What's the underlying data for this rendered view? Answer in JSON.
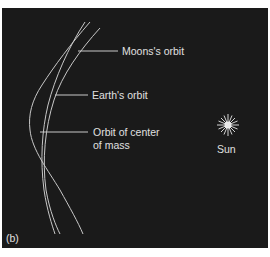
{
  "figure": {
    "panel_label": "(b)",
    "background_color": "#1a1a1a",
    "line_color": "#c8c8c8",
    "labels": {
      "moon_orbit": "Moons's orbit",
      "earth_orbit": "Earth's orbit",
      "center_of_mass_line1": "Orbit of center",
      "center_of_mass_line2": "of mass",
      "sun": "Sun"
    },
    "icons": {
      "sun": "starburst"
    }
  }
}
